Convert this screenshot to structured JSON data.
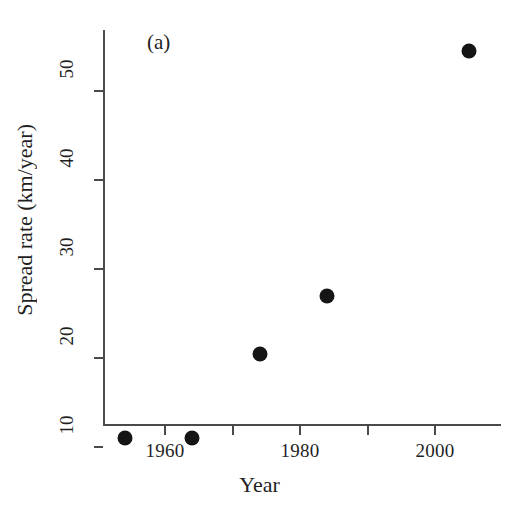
{
  "figure": {
    "panel_tag": "(a)",
    "point_color": "#151515",
    "axis_color": "#4a4a4a"
  },
  "chart_data": {
    "type": "scatter",
    "title": "",
    "subtitle": "",
    "xlabel": "Year",
    "ylabel": "Spread rate (km/year)",
    "annotations": [
      "(a)"
    ],
    "grid": false,
    "legend": null,
    "xlim": [
      1949,
      2008
    ],
    "ylim": [
      8.5,
      57
    ],
    "xticks": [
      1960,
      1980,
      2000
    ],
    "xtick_labels": [
      "1960",
      "1980",
      "2000"
    ],
    "xminor_ticks": [
      1970,
      1990
    ],
    "yticks": [
      10,
      20,
      30,
      40,
      50
    ],
    "ytick_labels": [
      "10",
      "20",
      "30",
      "40",
      "50"
    ],
    "series": [
      {
        "name": "Spread rate",
        "marker": "filled-circle",
        "color": "#151515",
        "x": [
          1954,
          1964,
          1974,
          1984,
          2005
        ],
        "y": [
          11.0,
          11.0,
          20.5,
          27.0,
          54.5
        ]
      }
    ]
  }
}
